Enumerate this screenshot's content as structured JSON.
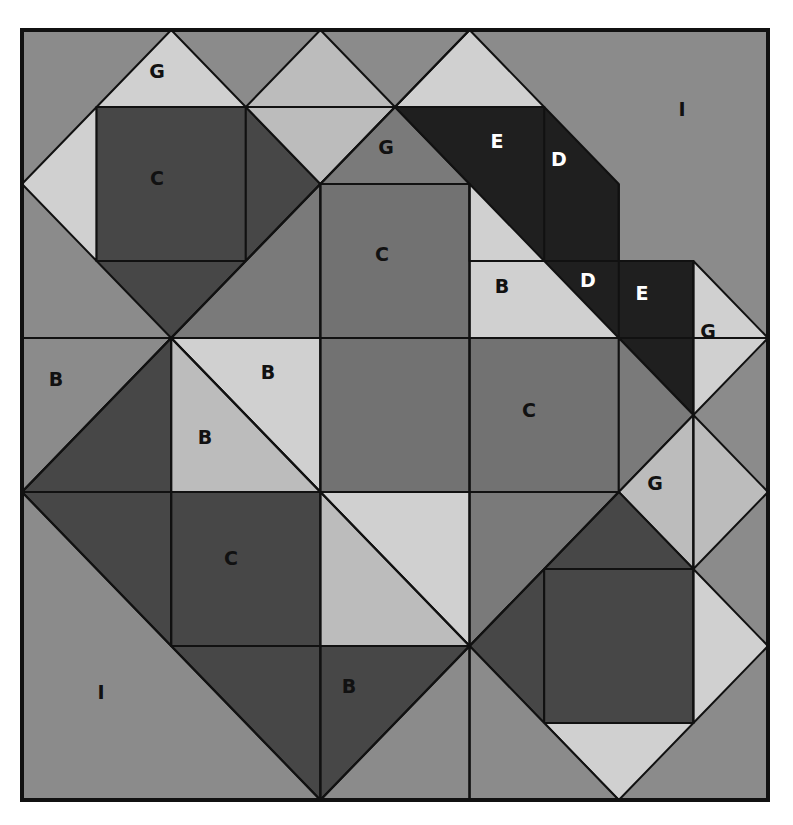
{
  "diagram": {
    "grid": {
      "cols": 10,
      "rows": 10,
      "origin_x": 22,
      "origin_y": 30,
      "cell_w": 74.6,
      "cell_h": 77.0
    },
    "palette": {
      "background_I": "#8b8b8b",
      "medium": "#7a7a7a",
      "medium_C": "#727272",
      "dark": "#474747",
      "darkest": "#1f1f1f",
      "light": "#bcbcbc",
      "lightest": "#d0d0d0",
      "frame": "#111111"
    },
    "labels": [
      {
        "text": "G",
        "x": 157,
        "y": 71,
        "color": "#111111"
      },
      {
        "text": "C",
        "x": 157,
        "y": 178,
        "color": "#111111"
      },
      {
        "text": "G",
        "x": 386,
        "y": 147,
        "color": "#111111"
      },
      {
        "text": "E",
        "x": 497,
        "y": 141,
        "color": "#ffffff"
      },
      {
        "text": "D",
        "x": 559,
        "y": 159,
        "color": "#ffffff"
      },
      {
        "text": "I",
        "x": 682,
        "y": 109,
        "color": "#111111"
      },
      {
        "text": "C",
        "x": 382,
        "y": 254,
        "color": "#111111"
      },
      {
        "text": "B",
        "x": 502,
        "y": 286,
        "color": "#111111"
      },
      {
        "text": "D",
        "x": 588,
        "y": 280,
        "color": "#ffffff"
      },
      {
        "text": "E",
        "x": 642,
        "y": 293,
        "color": "#ffffff"
      },
      {
        "text": "G",
        "x": 708,
        "y": 331,
        "color": "#111111"
      },
      {
        "text": "B",
        "x": 56,
        "y": 379,
        "color": "#111111"
      },
      {
        "text": "B",
        "x": 268,
        "y": 372,
        "color": "#111111"
      },
      {
        "text": "B",
        "x": 205,
        "y": 437,
        "color": "#111111"
      },
      {
        "text": "C",
        "x": 529,
        "y": 410,
        "color": "#111111"
      },
      {
        "text": "G",
        "x": 655,
        "y": 483,
        "color": "#111111"
      },
      {
        "text": "C",
        "x": 231,
        "y": 558,
        "color": "#111111"
      },
      {
        "text": "I",
        "x": 101,
        "y": 692,
        "color": "#111111"
      },
      {
        "text": "B",
        "x": 349,
        "y": 686,
        "color": "#111111"
      }
    ],
    "pieces": [
      {
        "id": "tl-g-top",
        "fill": "lightest",
        "pts": [
          [
            1,
            1
          ],
          [
            2,
            0
          ],
          [
            3,
            1
          ]
        ]
      },
      {
        "id": "tl-left",
        "fill": "lightest",
        "pts": [
          [
            0,
            2
          ],
          [
            1,
            1
          ],
          [
            1,
            3
          ]
        ]
      },
      {
        "id": "tl-c",
        "fill": "dark",
        "pts": [
          [
            1,
            1
          ],
          [
            3,
            1
          ],
          [
            3,
            3
          ],
          [
            1,
            3
          ]
        ]
      },
      {
        "id": "tl-right",
        "fill": "dark",
        "pts": [
          [
            3,
            1
          ],
          [
            4,
            2
          ],
          [
            3,
            3
          ]
        ]
      },
      {
        "id": "tl-bottom",
        "fill": "dark",
        "pts": [
          [
            1,
            3
          ],
          [
            3,
            3
          ],
          [
            2,
            4
          ]
        ]
      },
      {
        "id": "top-mid-a",
        "fill": "light",
        "pts": [
          [
            3,
            1
          ],
          [
            4,
            0
          ],
          [
            5,
            1
          ]
        ]
      },
      {
        "id": "top-mid-b",
        "fill": "light",
        "pts": [
          [
            3,
            1
          ],
          [
            5,
            1
          ],
          [
            4,
            2
          ]
        ]
      },
      {
        "id": "g-center",
        "fill": "medium",
        "pts": [
          [
            4,
            2
          ],
          [
            5,
            1
          ],
          [
            6,
            2
          ]
        ]
      },
      {
        "id": "top-right-tri",
        "fill": "lightest",
        "pts": [
          [
            5,
            1
          ],
          [
            6,
            0
          ],
          [
            7,
            1
          ]
        ]
      },
      {
        "id": "mid-left-tri",
        "fill": "medium",
        "pts": [
          [
            2,
            4
          ],
          [
            4,
            2
          ],
          [
            4,
            4
          ]
        ]
      },
      {
        "id": "c-center-top",
        "fill": "medium_C",
        "pts": [
          [
            4,
            2
          ],
          [
            6,
            2
          ],
          [
            6,
            4
          ],
          [
            4,
            4
          ]
        ]
      },
      {
        "id": "d-band-1",
        "fill": "darkest",
        "pts": [
          [
            5,
            1
          ],
          [
            7,
            1
          ],
          [
            8,
            2
          ],
          [
            8,
            3
          ],
          [
            9,
            3
          ],
          [
            9,
            5
          ],
          [
            8,
            4
          ],
          [
            7,
            4
          ],
          [
            6,
            3
          ],
          [
            6,
            2
          ]
        ]
      },
      {
        "id": "b-light",
        "fill": "lightest",
        "pts": [
          [
            6,
            2
          ],
          [
            8,
            4
          ],
          [
            6,
            4
          ]
        ]
      },
      {
        "id": "g-right",
        "fill": "lightest",
        "pts": [
          [
            9,
            3
          ],
          [
            10,
            4
          ],
          [
            9,
            5
          ]
        ]
      },
      {
        "id": "b-left",
        "fill": "background_I",
        "pts": [
          [
            0,
            4
          ],
          [
            2,
            4
          ],
          [
            0,
            6
          ]
        ]
      },
      {
        "id": "left-dark",
        "fill": "dark",
        "pts": [
          [
            0,
            6
          ],
          [
            2,
            4
          ],
          [
            2,
            6
          ]
        ]
      },
      {
        "id": "b-light-top",
        "fill": "lightest",
        "pts": [
          [
            2,
            4
          ],
          [
            4,
            4
          ],
          [
            4,
            6
          ]
        ]
      },
      {
        "id": "b-light-bottom",
        "fill": "light",
        "pts": [
          [
            2,
            4
          ],
          [
            4,
            6
          ],
          [
            2,
            6
          ]
        ]
      },
      {
        "id": "c-center",
        "fill": "medium_C",
        "pts": [
          [
            4,
            4
          ],
          [
            6,
            4
          ],
          [
            6,
            6
          ],
          [
            4,
            6
          ]
        ]
      },
      {
        "id": "c-right",
        "fill": "medium_C",
        "pts": [
          [
            6,
            4
          ],
          [
            8,
            4
          ],
          [
            8,
            6
          ],
          [
            6,
            6
          ]
        ]
      },
      {
        "id": "right-mid-tri",
        "fill": "medium",
        "pts": [
          [
            8,
            4
          ],
          [
            9,
            5
          ],
          [
            8,
            6
          ]
        ]
      },
      {
        "id": "g-mid",
        "fill": "light",
        "pts": [
          [
            8,
            6
          ],
          [
            9,
            5
          ],
          [
            9,
            7
          ]
        ]
      },
      {
        "id": "right-col-diamond",
        "fill": "light",
        "pts": [
          [
            9,
            5
          ],
          [
            10,
            6
          ],
          [
            9,
            7
          ]
        ]
      },
      {
        "id": "bl-dark",
        "fill": "dark",
        "pts": [
          [
            0,
            6
          ],
          [
            2,
            6
          ],
          [
            2,
            8
          ]
        ]
      },
      {
        "id": "bl-c",
        "fill": "dark",
        "pts": [
          [
            2,
            6
          ],
          [
            4,
            6
          ],
          [
            4,
            8
          ],
          [
            2,
            8
          ]
        ]
      },
      {
        "id": "bl-dark-bottom",
        "fill": "dark",
        "pts": [
          [
            2,
            8
          ],
          [
            4,
            8
          ],
          [
            4,
            10
          ]
        ]
      },
      {
        "id": "mid-light-a",
        "fill": "lightest",
        "pts": [
          [
            4,
            6
          ],
          [
            6,
            6
          ],
          [
            6,
            8
          ]
        ]
      },
      {
        "id": "mid-light-b",
        "fill": "light",
        "pts": [
          [
            4,
            6
          ],
          [
            6,
            8
          ],
          [
            4,
            8
          ]
        ]
      },
      {
        "id": "mid-med",
        "fill": "medium",
        "pts": [
          [
            6,
            6
          ],
          [
            8,
            6
          ],
          [
            6,
            8
          ]
        ]
      },
      {
        "id": "br-dark-top",
        "fill": "dark",
        "pts": [
          [
            7,
            7
          ],
          [
            8,
            6
          ],
          [
            9,
            7
          ]
        ]
      },
      {
        "id": "br-dark-left",
        "fill": "dark",
        "pts": [
          [
            6,
            8
          ],
          [
            7,
            7
          ],
          [
            7,
            9
          ]
        ]
      },
      {
        "id": "br-c",
        "fill": "dark",
        "pts": [
          [
            7,
            7
          ],
          [
            9,
            7
          ],
          [
            9,
            9
          ],
          [
            7,
            9
          ]
        ]
      },
      {
        "id": "br-light-right",
        "fill": "lightest",
        "pts": [
          [
            9,
            7
          ],
          [
            10,
            8
          ],
          [
            9,
            9
          ]
        ]
      },
      {
        "id": "br-light-bottom",
        "fill": "lightest",
        "pts": [
          [
            7,
            9
          ],
          [
            9,
            9
          ],
          [
            8,
            10
          ]
        ]
      },
      {
        "id": "b-bottom",
        "fill": "dark",
        "pts": [
          [
            4,
            8
          ],
          [
            6,
            8
          ],
          [
            4,
            10
          ]
        ]
      },
      {
        "id": "b-bottom-med",
        "fill": "background_I",
        "pts": [
          [
            4,
            10
          ],
          [
            6,
            8
          ],
          [
            6,
            10
          ]
        ]
      },
      {
        "id": "br-bottom-med",
        "fill": "background_I",
        "pts": [
          [
            6,
            8
          ],
          [
            7,
            9
          ],
          [
            8,
            10
          ],
          [
            6,
            10
          ]
        ]
      }
    ],
    "lines": [
      [
        [
          0,
          4
        ],
        [
          10,
          4
        ]
      ],
      [
        [
          0,
          6
        ],
        [
          8,
          6
        ]
      ],
      [
        [
          0,
          2
        ],
        [
          0,
          2
        ]
      ],
      [
        [
          1,
          1
        ],
        [
          7,
          1
        ]
      ],
      [
        [
          4,
          2
        ],
        [
          6,
          2
        ]
      ],
      [
        [
          4,
          8
        ],
        [
          6,
          8
        ]
      ],
      [
        [
          4,
          2
        ],
        [
          4,
          10
        ]
      ],
      [
        [
          6,
          2
        ],
        [
          6,
          10
        ]
      ],
      [
        [
          2,
          4
        ],
        [
          2,
          8
        ]
      ],
      [
        [
          9,
          3
        ],
        [
          9,
          9
        ]
      ],
      [
        [
          7,
          1
        ],
        [
          7,
          3
        ]
      ],
      [
        [
          8,
          2
        ],
        [
          8,
          4
        ]
      ],
      [
        [
          6,
          3
        ],
        [
          9,
          3
        ]
      ],
      [
        [
          8,
          4
        ],
        [
          9,
          4
        ]
      ],
      [
        [
          0,
          6
        ],
        [
          4,
          10
        ]
      ],
      [
        [
          0,
          6
        ],
        [
          2,
          4
        ]
      ],
      [
        [
          2,
          4
        ],
        [
          4,
          6
        ]
      ],
      [
        [
          4,
          6
        ],
        [
          6,
          8
        ]
      ],
      [
        [
          6,
          8
        ],
        [
          8,
          6
        ]
      ],
      [
        [
          4,
          10
        ],
        [
          6,
          8
        ]
      ],
      [
        [
          4,
          2
        ],
        [
          6,
          0
        ]
      ],
      [
        [
          2,
          4
        ],
        [
          4,
          2
        ]
      ]
    ]
  }
}
